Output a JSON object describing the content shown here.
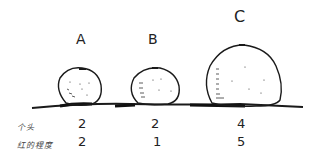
{
  "fruits": [
    {
      "label": "A",
      "size": "2",
      "redness": "2"
    },
    {
      "label": "B",
      "size": "2",
      "redness": "1"
    },
    {
      "label": "C",
      "size": "4",
      "redness": "5"
    }
  ],
  "rows": {
    "size_label": "个头",
    "redness_label": "红的程度"
  },
  "colors": {
    "ink": "#1a1a1a",
    "background": "#ffffff"
  }
}
